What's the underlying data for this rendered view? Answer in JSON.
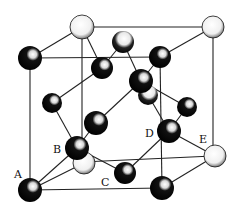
{
  "diagram": {
    "type": "crystal-lattice-unit-cell",
    "labels": [
      {
        "id": "A",
        "text": "A",
        "x": 14,
        "y": 178
      },
      {
        "id": "B",
        "text": "B",
        "x": 53,
        "y": 150
      },
      {
        "id": "C",
        "text": "C",
        "x": 101,
        "y": 184
      },
      {
        "id": "D",
        "text": "D",
        "x": 145,
        "y": 135
      },
      {
        "id": "E",
        "text": "E",
        "x": 199,
        "y": 141
      }
    ],
    "colors": {
      "line": "#222222",
      "atom_dark": "#0a0a0a",
      "atom_light": "#f4f4f4"
    },
    "atoms": [
      {
        "id": "back-top-left",
        "x": 82,
        "y": 27,
        "r": 12,
        "shade": "light"
      },
      {
        "id": "back-top-right",
        "x": 213,
        "y": 27,
        "r": 11,
        "shade": "light"
      },
      {
        "id": "top-face-center",
        "x": 123,
        "y": 42,
        "r": 11,
        "shade": "light-dark"
      },
      {
        "id": "front-top-left",
        "x": 30,
        "y": 58,
        "r": 12,
        "shade": "dark"
      },
      {
        "id": "front-top-right",
        "x": 160,
        "y": 57,
        "r": 11,
        "shade": "dark"
      },
      {
        "id": "upper-interior",
        "x": 102,
        "y": 68,
        "r": 11,
        "shade": "dark"
      },
      {
        "id": "behind-center",
        "x": 148,
        "y": 95,
        "r": 10,
        "shade": "dark"
      },
      {
        "id": "center",
        "x": 141,
        "y": 81,
        "r": 12,
        "shade": "dark"
      },
      {
        "id": "right-face",
        "x": 187,
        "y": 107,
        "r": 10,
        "shade": "dark"
      },
      {
        "id": "left-face-upper",
        "x": 52,
        "y": 103,
        "r": 10,
        "shade": "dark"
      },
      {
        "id": "interior-lower",
        "x": 96,
        "y": 123,
        "r": 12,
        "shade": "dark"
      },
      {
        "id": "behind-B",
        "x": 84,
        "y": 163,
        "r": 11,
        "shade": "light"
      },
      {
        "id": "B",
        "x": 77,
        "y": 148,
        "r": 12,
        "shade": "dark"
      },
      {
        "id": "D",
        "x": 169,
        "y": 131,
        "r": 12,
        "shade": "dark"
      },
      {
        "id": "E",
        "x": 215,
        "y": 156,
        "r": 11,
        "shade": "light"
      },
      {
        "id": "C",
        "x": 125,
        "y": 173,
        "r": 11,
        "shade": "dark"
      },
      {
        "id": "A",
        "x": 30,
        "y": 190,
        "r": 12,
        "shade": "dark"
      },
      {
        "id": "front-bottom-right",
        "x": 162,
        "y": 188,
        "r": 12,
        "shade": "dark"
      }
    ]
  }
}
